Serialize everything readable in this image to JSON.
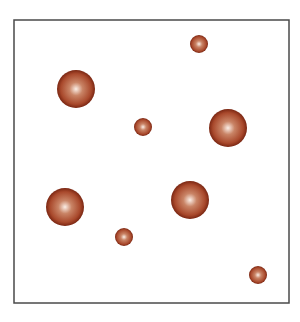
{
  "canvas": {
    "width": 300,
    "height": 322,
    "background": "#ffffff"
  },
  "frame": {
    "x": 14,
    "y": 20,
    "width": 275,
    "height": 283,
    "stroke": "#4a4a4a",
    "stroke_width": 1.5,
    "fill": "#ffffff"
  },
  "sphere_colors": {
    "highlight": "#fbeee6",
    "mid": "#c98466",
    "body": "#a9492c",
    "rim": "#7a2612"
  },
  "spheres": [
    {
      "id": "sphere-1",
      "cx": 76,
      "cy": 89,
      "r": 19,
      "size": "large"
    },
    {
      "id": "sphere-2",
      "cx": 199,
      "cy": 44,
      "r": 9,
      "size": "small"
    },
    {
      "id": "sphere-3",
      "cx": 228,
      "cy": 128,
      "r": 19,
      "size": "large"
    },
    {
      "id": "sphere-4",
      "cx": 143,
      "cy": 127,
      "r": 9,
      "size": "small"
    },
    {
      "id": "sphere-5",
      "cx": 65,
      "cy": 207,
      "r": 19,
      "size": "large"
    },
    {
      "id": "sphere-6",
      "cx": 190,
      "cy": 200,
      "r": 19,
      "size": "large"
    },
    {
      "id": "sphere-7",
      "cx": 124,
      "cy": 237,
      "r": 9,
      "size": "small"
    },
    {
      "id": "sphere-8",
      "cx": 258,
      "cy": 275,
      "r": 9,
      "size": "small"
    }
  ]
}
